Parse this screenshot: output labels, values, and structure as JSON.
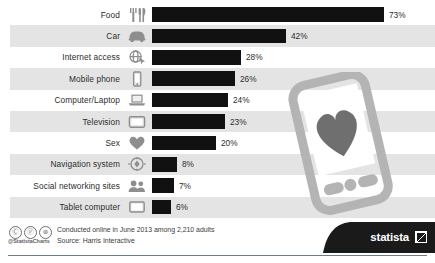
{
  "chart_data": {
    "type": "bar",
    "title": "",
    "xlabel": "",
    "ylabel": "",
    "orientation": "horizontal",
    "categories": [
      "Food",
      "Car",
      "Internet access",
      "Mobile phone",
      "Computer/Laptop",
      "Television",
      "Sex",
      "Navigation system",
      "Social networking sites",
      "Tablet computer"
    ],
    "values": [
      73,
      42,
      28,
      26,
      24,
      23,
      20,
      8,
      7,
      6
    ],
    "value_labels": [
      "73%",
      "42%",
      "28%",
      "26%",
      "24%",
      "23%",
      "20%",
      "8%",
      "7%",
      "6%"
    ],
    "xlim": [
      0,
      100
    ],
    "grid": false,
    "legend": "none",
    "bar_color": "#111111",
    "stripe_color": "#e4e4e4",
    "icons": [
      "cutlery-icon",
      "car-icon",
      "globe-cursor-icon",
      "mobile-phone-icon",
      "laptop-icon",
      "television-icon",
      "heart-icon",
      "navigation-compass-icon",
      "people-icon",
      "tablet-icon"
    ]
  },
  "rows": [
    {
      "label": "Food",
      "value": 73,
      "value_label": "73%",
      "icon": "cutlery-icon"
    },
    {
      "label": "Car",
      "value": 42,
      "value_label": "42%",
      "icon": "car-icon"
    },
    {
      "label": "Internet access",
      "value": 28,
      "value_label": "28%",
      "icon": "globe-cursor-icon"
    },
    {
      "label": "Mobile phone",
      "value": 26,
      "value_label": "26%",
      "icon": "mobile-phone-icon"
    },
    {
      "label": "Computer/Laptop",
      "value": 24,
      "value_label": "24%",
      "icon": "laptop-icon"
    },
    {
      "label": "Television",
      "value": 23,
      "value_label": "23%",
      "icon": "television-icon"
    },
    {
      "label": "Sex",
      "value": 20,
      "value_label": "20%",
      "icon": "heart-icon"
    },
    {
      "label": "Navigation system",
      "value": 8,
      "value_label": "8%",
      "icon": "navigation-compass-icon"
    },
    {
      "label": "Social networking sites",
      "value": 7,
      "value_label": "7%",
      "icon": "people-icon"
    },
    {
      "label": "Tablet computer",
      "value": 6,
      "value_label": "6%",
      "icon": "tablet-icon"
    }
  ],
  "footer": {
    "note_line1": "Conducted online in June 2013 among 2,210 adults",
    "note_line2": "Source: Harris Interactive",
    "handle": "@StatistaCharts",
    "cc_badges": [
      "cc",
      "by",
      "nd"
    ],
    "cc_glyphs": [
      "Ⓒ",
      "ⓟ",
      "⊜"
    ],
    "logo_text": "statista"
  },
  "illustration": {
    "name": "smartphone-with-heart",
    "body_color": "#b4b4b4",
    "heart_color": "#6f6f6f"
  },
  "colors": {
    "bar": "#111111",
    "stripe": "#e4e4e4",
    "text": "#2d2d2d",
    "rule": "#6d7b84",
    "logo_bg": "#1a1a1a"
  }
}
